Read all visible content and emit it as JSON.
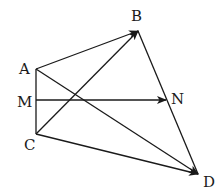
{
  "diagram": {
    "type": "vector-geometry",
    "stroke_color": "#1a1a1a",
    "background": "#ffffff",
    "points": [
      {
        "id": "A",
        "label": "A",
        "x": 36,
        "y": 69,
        "lx": 19,
        "ly": 74
      },
      {
        "id": "B",
        "label": "B",
        "x": 138,
        "y": 31,
        "lx": 131,
        "ly": 21
      },
      {
        "id": "C",
        "label": "C",
        "x": 36,
        "y": 134,
        "lx": 24,
        "ly": 150
      },
      {
        "id": "M",
        "label": "M",
        "x": 36,
        "y": 100,
        "lx": 17,
        "ly": 107
      },
      {
        "id": "N",
        "label": "N",
        "x": 166,
        "y": 100,
        "lx": 171,
        "ly": 104
      },
      {
        "id": "D",
        "label": "D",
        "x": 198,
        "y": 174,
        "lx": 203,
        "ly": 187
      }
    ],
    "segments": [
      {
        "from": "A",
        "to": "C",
        "arrow": false
      },
      {
        "from": "B",
        "to": "D",
        "arrow": false
      }
    ],
    "vectors": [
      {
        "from": "A",
        "to": "B",
        "arrow": true
      },
      {
        "from": "C",
        "to": "B",
        "arrow": true
      },
      {
        "from": "M",
        "to": "N",
        "arrow": true
      },
      {
        "from": "A",
        "to": "D",
        "arrow": true
      },
      {
        "from": "C",
        "to": "D",
        "arrow": true
      }
    ]
  }
}
